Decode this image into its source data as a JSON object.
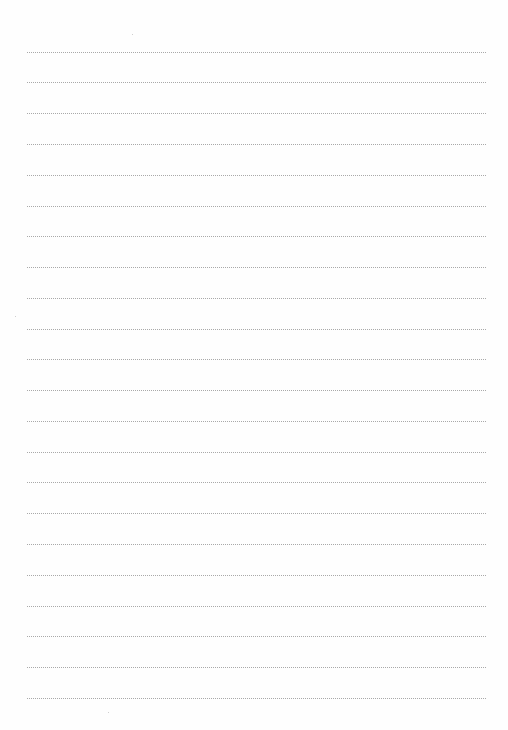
{
  "page": {
    "type": "lined-paper",
    "background_color": "#fefefe",
    "rule_color": "#9a9a9a",
    "rule_style": "dotted",
    "rule_left": 27,
    "rule_right": 487,
    "rule_positions_y": [
      52,
      82,
      113,
      144,
      175,
      206,
      236,
      267,
      298,
      329,
      359,
      390,
      421,
      452,
      482,
      513,
      544,
      575,
      606,
      636,
      667,
      698
    ],
    "text_content": ""
  }
}
